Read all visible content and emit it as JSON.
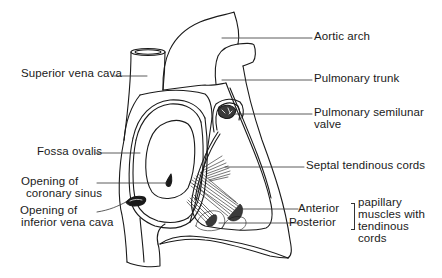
{
  "diagram": {
    "stroke_color": "#1a1a1a",
    "background": "#ffffff",
    "labels": {
      "aortic_arch": "Aortic arch",
      "superior_vena_cava": "Superior vena cava",
      "pulmonary_trunk": "Pulmonary trunk",
      "pulmonary_semilunar_valve_line1": "Pulmonary semilunar",
      "pulmonary_semilunar_valve_line2": "valve",
      "fossa_ovalis": "Fossa ovalis",
      "septal_tendinous_cords": "Septal tendinous cords",
      "opening_coronary_sinus_line1": "Opening of",
      "opening_coronary_sinus_line2": "coronary sinus",
      "opening_ivc_line1": "Opening of",
      "opening_ivc_line2": "inferior vena cava",
      "anterior": "Anterior",
      "posterior": "Posterior",
      "papillary_line1": "papillary",
      "papillary_line2": "muscles with",
      "papillary_line3": "tendinous",
      "papillary_line4": "cords"
    }
  }
}
